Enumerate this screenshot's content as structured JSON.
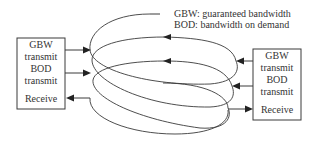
{
  "legend": {
    "line1": "GBW: guaranteed bandwidth",
    "line2": "BOD: bandwidth on demand"
  },
  "left_node": {
    "lines": [
      "GBW",
      "transmit",
      "BOD",
      "transmit",
      "Receive"
    ]
  },
  "right_node": {
    "lines": [
      "GBW",
      "transmit",
      "BOD",
      "transmit",
      "Receive"
    ]
  },
  "colors": {
    "stroke": "#3a3a3a",
    "text": "#333333",
    "background": "#ffffff"
  }
}
